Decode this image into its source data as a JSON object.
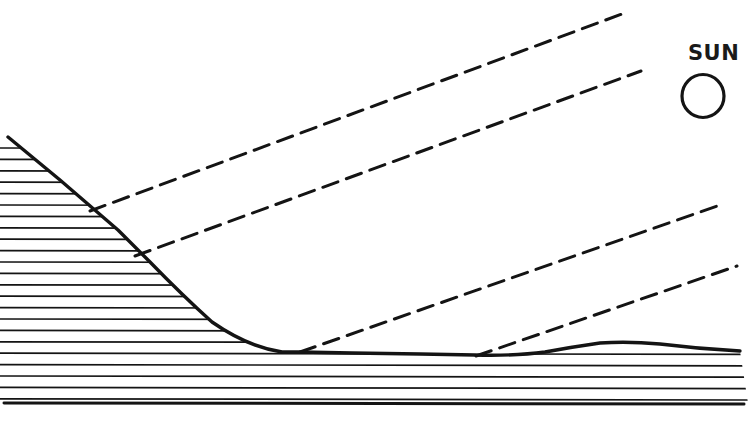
{
  "figure": {
    "background_color": "#ffffff",
    "ink_color": "#141414",
    "width": 748,
    "height": 421
  },
  "sun": {
    "label": "SUN",
    "label_x": 688,
    "label_y": 60,
    "circle_cx": 703,
    "circle_cy": 96,
    "circle_rx": 21,
    "circle_ry": 21.5,
    "stroke_width": 3.2
  },
  "terrain": {
    "name": "ground-profile",
    "stroke_width": 3.4,
    "description": "Steep slope from upper left descending to a flat valley floor, then a low rounded hill on the right",
    "profile_path": "M 8,137 L 60,180 L 118,230 L 150,262 Q 182,295 212,322 Q 248,347 282,352 L 300,352 L 352,353 L 420,354 L 475,355 Q 516,356 545,352 Q 572,347 600,343 Q 628,341 660,344 Q 700,349 740,351",
    "hatch": {
      "name": "ground-hatching",
      "line_count": 24,
      "spacing": 11.4,
      "first_y": 148,
      "stroke_width": 1.7,
      "bottom_y": 403,
      "bottom_stroke_width": 3.0
    }
  },
  "rays": [
    {
      "id": "ray-1",
      "label": "solar-ray-upper",
      "x1": 90,
      "y1": 211,
      "x2": 622,
      "y2": 14
    },
    {
      "id": "ray-2",
      "label": "solar-ray-second",
      "x1": 135,
      "y1": 256,
      "x2": 641,
      "y2": 71
    },
    {
      "id": "ray-3",
      "label": "solar-ray-third",
      "x1": 300,
      "y1": 352,
      "x2": 723,
      "y2": 204
    },
    {
      "id": "ray-4",
      "label": "solar-ray-lower",
      "x1": 476,
      "y1": 356,
      "x2": 737,
      "y2": 266
    }
  ],
  "ray_style": {
    "stroke_width": 3.0,
    "dash_length": 16,
    "gap_length": 9
  }
}
